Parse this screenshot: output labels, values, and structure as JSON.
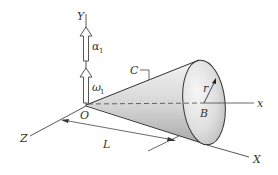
{
  "diagram": {
    "type": "3d-mechanics-figure",
    "labels": {
      "Y": "Y",
      "X": "X",
      "Z": "Z",
      "x": "x",
      "O": "O",
      "B": "B",
      "C": "C",
      "r": "r",
      "L": "L",
      "alpha": "α",
      "alpha_sub": "1",
      "omega": "ω",
      "omega_sub": "1"
    },
    "colors": {
      "line": "#444444",
      "cone_light": "#f2f2f2",
      "cone_dark": "#b5b5b5",
      "text": "#333333"
    }
  }
}
